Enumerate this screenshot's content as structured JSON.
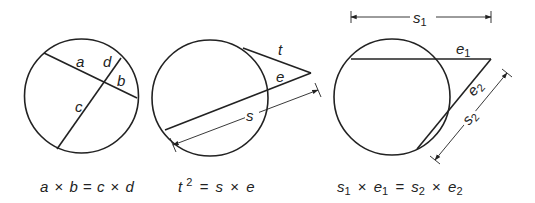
{
  "diagram": {
    "panels": [
      {
        "id": "chords",
        "labels": {
          "a": "a",
          "b": "b",
          "c": "c",
          "d": "d"
        },
        "formula": {
          "lhs_1": "a",
          "op_1": "×",
          "lhs_2": "b",
          "eq": "=",
          "rhs_1": "c",
          "op_2": "×",
          "rhs_2": "d"
        }
      },
      {
        "id": "tangent-secant",
        "labels": {
          "t": "t",
          "e": "e",
          "s": "s"
        },
        "formula": {
          "lhs_base": "t",
          "lhs_exp": "2",
          "eq": "=",
          "rhs_1": "s",
          "op": "×",
          "rhs_2": "e"
        }
      },
      {
        "id": "secant-secant",
        "labels": {
          "s1": "s",
          "s1_sub": "1",
          "e1": "e",
          "e1_sub": "1",
          "e2": "e",
          "e2_sub": "2",
          "s2": "s",
          "s2_sub": "2"
        },
        "formula": {
          "a": "s",
          "a_sub": "1",
          "op_1": "×",
          "b": "e",
          "b_sub": "1",
          "eq": "=",
          "c": "s",
          "c_sub": "2",
          "op_2": "×",
          "d": "e",
          "d_sub": "2"
        }
      }
    ],
    "colors": {
      "stroke": "#222222",
      "background": "#ffffff"
    }
  }
}
